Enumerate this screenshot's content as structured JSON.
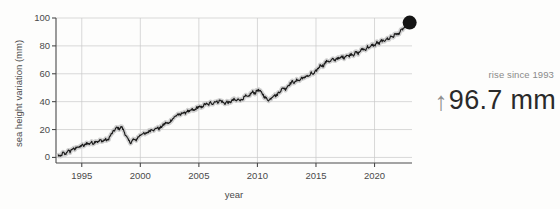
{
  "annotation": {
    "caption": "rise since 1993",
    "arrow_glyph": "↑",
    "value": "96.7 mm",
    "caption_color": "#8a8a8a",
    "value_color": "#2a2a2a",
    "arrow_color": "#8f8f8f"
  },
  "chart_data": {
    "type": "line",
    "title": "",
    "xlabel": "year",
    "ylabel": "sea height variation (mm)",
    "xlim": [
      1992.8,
      2023.2
    ],
    "ylim": [
      -4,
      100
    ],
    "xticks": [
      1995,
      2000,
      2005,
      2010,
      2015,
      2020
    ],
    "xticklabels": [
      "1995",
      "2000",
      "2005",
      "2010",
      "2015",
      "2020"
    ],
    "yticks": [
      0,
      20,
      40,
      60,
      80,
      100
    ],
    "yticklabels": [
      "0",
      "20",
      "40",
      "60",
      "80",
      "100"
    ],
    "grid": true,
    "grid_color": "#c9c9c9",
    "legend": "none",
    "line_color": "#1a1a1a",
    "band_color": "#c8c8c8",
    "endpoint_marker": {
      "x": 2023.0,
      "y": 96.7,
      "color": "#141414",
      "radius_px": 7
    },
    "series": [
      {
        "name": "sea height variation",
        "x": [
          1993.0,
          1993.2,
          1993.4,
          1993.6,
          1993.8,
          1994.0,
          1994.2,
          1994.4,
          1994.6,
          1994.8,
          1995.0,
          1995.2,
          1995.4,
          1995.6,
          1995.8,
          1996.0,
          1996.2,
          1996.4,
          1996.6,
          1996.8,
          1997.0,
          1997.2,
          1997.4,
          1997.6,
          1997.8,
          1998.0,
          1998.2,
          1998.4,
          1998.6,
          1998.8,
          1999.0,
          1999.2,
          1999.4,
          1999.6,
          1999.8,
          2000.0,
          2000.2,
          2000.4,
          2000.6,
          2000.8,
          2001.0,
          2001.2,
          2001.4,
          2001.6,
          2001.8,
          2002.0,
          2002.2,
          2002.4,
          2002.6,
          2002.8,
          2003.0,
          2003.2,
          2003.4,
          2003.6,
          2003.8,
          2004.0,
          2004.2,
          2004.4,
          2004.6,
          2004.8,
          2005.0,
          2005.2,
          2005.4,
          2005.6,
          2005.8,
          2006.0,
          2006.2,
          2006.4,
          2006.6,
          2006.8,
          2007.0,
          2007.2,
          2007.4,
          2007.6,
          2007.8,
          2008.0,
          2008.2,
          2008.4,
          2008.6,
          2008.8,
          2009.0,
          2009.2,
          2009.4,
          2009.6,
          2009.8,
          2010.0,
          2010.2,
          2010.4,
          2010.6,
          2010.8,
          2011.0,
          2011.2,
          2011.4,
          2011.6,
          2011.8,
          2012.0,
          2012.2,
          2012.4,
          2012.6,
          2012.8,
          2013.0,
          2013.2,
          2013.4,
          2013.6,
          2013.8,
          2014.0,
          2014.2,
          2014.4,
          2014.6,
          2014.8,
          2015.0,
          2015.2,
          2015.4,
          2015.6,
          2015.8,
          2016.0,
          2016.2,
          2016.4,
          2016.6,
          2016.8,
          2017.0,
          2017.2,
          2017.4,
          2017.6,
          2017.8,
          2018.0,
          2018.2,
          2018.4,
          2018.6,
          2018.8,
          2019.0,
          2019.2,
          2019.4,
          2019.6,
          2019.8,
          2020.0,
          2020.2,
          2020.4,
          2020.6,
          2020.8,
          2021.0,
          2021.2,
          2021.4,
          2021.6,
          2021.8,
          2022.0,
          2022.2,
          2022.4,
          2022.6,
          2022.8,
          2023.0
        ],
        "y": [
          1.5,
          0.5,
          3.5,
          2.0,
          5.0,
          4.0,
          6.5,
          5.5,
          8.0,
          7.0,
          9.0,
          8.0,
          10.5,
          9.5,
          11.0,
          10.0,
          12.0,
          11.0,
          12.5,
          11.5,
          13.0,
          12.0,
          15.0,
          17.5,
          19.5,
          21.5,
          20.5,
          22.0,
          19.0,
          15.0,
          12.0,
          10.5,
          13.0,
          12.0,
          14.5,
          16.0,
          17.5,
          16.5,
          18.0,
          19.0,
          20.5,
          19.5,
          21.5,
          20.5,
          22.0,
          23.5,
          25.0,
          24.0,
          26.5,
          28.0,
          29.5,
          31.0,
          30.0,
          32.5,
          31.5,
          33.5,
          32.5,
          34.5,
          33.5,
          35.5,
          36.5,
          35.5,
          37.5,
          38.5,
          37.5,
          39.5,
          38.5,
          40.5,
          39.5,
          41.0,
          40.0,
          38.5,
          40.0,
          39.0,
          40.5,
          41.5,
          40.5,
          42.0,
          41.0,
          42.5,
          44.0,
          43.0,
          45.5,
          47.0,
          46.0,
          48.5,
          47.5,
          46.0,
          43.5,
          42.0,
          41.0,
          43.0,
          45.0,
          44.0,
          46.5,
          48.0,
          50.0,
          49.0,
          51.5,
          53.0,
          54.5,
          53.5,
          56.0,
          55.0,
          57.5,
          56.5,
          59.0,
          58.0,
          60.5,
          59.5,
          62.0,
          64.0,
          66.5,
          65.5,
          68.0,
          69.5,
          68.5,
          70.5,
          69.5,
          71.5,
          70.5,
          72.5,
          71.5,
          73.5,
          72.5,
          74.5,
          73.5,
          75.5,
          74.5,
          76.5,
          78.0,
          77.0,
          79.5,
          78.5,
          81.0,
          80.0,
          82.5,
          81.5,
          84.0,
          83.0,
          85.5,
          84.5,
          87.0,
          86.5,
          89.0,
          88.0,
          90.5,
          92.0,
          93.5,
          95.0,
          96.7
        ]
      }
    ]
  }
}
